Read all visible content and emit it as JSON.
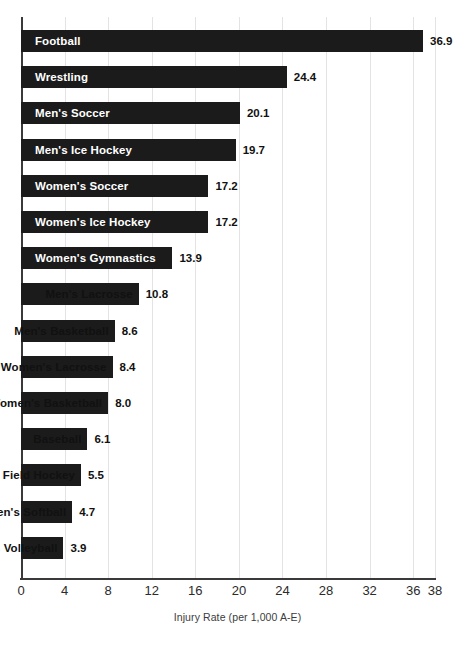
{
  "chart_data": {
    "type": "bar",
    "orientation": "horizontal",
    "title": "",
    "xlabel": "Injury Rate (per 1,000 A-E)",
    "ylabel": "",
    "xlim": [
      0,
      38
    ],
    "xticks": [
      0,
      4,
      8,
      12,
      16,
      20,
      24,
      28,
      32,
      36,
      38
    ],
    "xtick_labels": [
      "0",
      "4",
      "8",
      "12",
      "16",
      "20",
      "24",
      "28",
      "32",
      "36",
      "38"
    ],
    "grid": "vertical",
    "legend": "none",
    "bar_color": "#1b1b1b",
    "categories": [
      "Football",
      "Wrestling",
      "Men's Soccer",
      "Men's Ice Hockey",
      "Women's Soccer",
      "Women's Ice Hockey",
      "Women's Gymnastics",
      "Men's Lacrosse",
      "Men's Basketball",
      "Women's Lacrosse",
      "Women's Basketball",
      "Baseball",
      "Field Hockey",
      "Women's Softball",
      "Women's Volleyball"
    ],
    "values": [
      36.9,
      24.4,
      20.1,
      19.7,
      17.2,
      17.2,
      13.9,
      10.8,
      8.6,
      8.4,
      8.0,
      6.1,
      5.5,
      4.7,
      3.9
    ],
    "value_labels": [
      "36.9",
      "24.4",
      "20.1",
      "19.7",
      "17.2",
      "17.2",
      "13.9",
      "10.8",
      "8.6",
      "8.4",
      "8.0",
      "6.1",
      "5.5",
      "4.7",
      "3.9"
    ],
    "label_placement": [
      "inside",
      "inside",
      "inside",
      "inside",
      "inside",
      "inside",
      "inside",
      "outside",
      "outside",
      "outside",
      "outside",
      "outside",
      "outside",
      "outside",
      "outside"
    ]
  },
  "colors": {
    "bar": "#1b1b1b",
    "gridline": "#e3e3e3",
    "axis": "#3a3a3a",
    "label_inside": "#ffffff",
    "label_outside": "#111111",
    "background": "#ffffff"
  }
}
